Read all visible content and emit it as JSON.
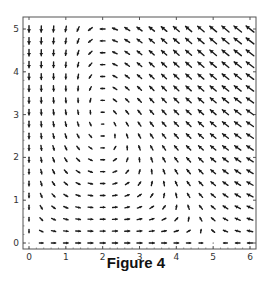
{
  "caption": "Figure 4",
  "chart_data": {
    "type": "vector_field",
    "title": "",
    "caption": "Figure 4",
    "xlabel": "",
    "ylabel": "",
    "xlim": [
      -0.16,
      6.16
    ],
    "ylim": [
      -0.14,
      5.28
    ],
    "x_ticks": [
      0,
      1,
      2,
      3,
      4,
      5,
      6
    ],
    "y_ticks": [
      0,
      1,
      2,
      3,
      4,
      5
    ],
    "x_tick_labels": [
      "0",
      "1",
      "2",
      "3",
      "4",
      "5",
      "6"
    ],
    "y_tick_labels": [
      "0",
      "1",
      "2",
      "3",
      "4",
      "5"
    ],
    "grid": false,
    "legend": null,
    "sample_grid": {
      "x_min": 0,
      "x_max": 6,
      "y_min": 0,
      "y_max": 5,
      "nx": 19,
      "ny": 19
    },
    "field": {
      "description": "Predator-prey flow: dx/dt = x(1 - x/5) - a x y, dy/dt = y(-c + d x)",
      "a": 0.214,
      "c": 0.6,
      "d": 0.3
    },
    "features": {
      "equilibria": [
        [
          0,
          0
        ],
        [
          5,
          0
        ],
        [
          2,
          2.8
        ]
      ],
      "rotation": "counterclockwise about (2, 2.8)",
      "x0_column": "arrows point straight down",
      "y0_row": "arrows point right for x<5, left for x>5"
    },
    "colors": {
      "arrow": "#1a1a1a",
      "frame": "#555555",
      "background": "#ffffff"
    }
  }
}
